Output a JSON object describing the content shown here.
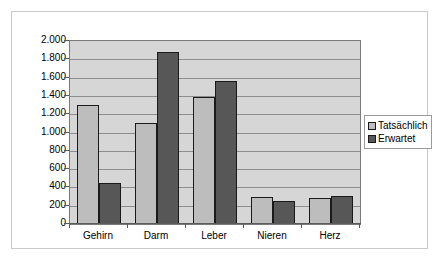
{
  "chart_data": {
    "type": "bar",
    "title": "",
    "subtitle": "",
    "xlabel": "",
    "ylabel": "",
    "categories": [
      "Gehirn",
      "Darm",
      "Leber",
      "Nieren",
      "Herz"
    ],
    "series": [
      {
        "name": "Tatsächlich",
        "color": "#bdbdbd",
        "values": [
          1300,
          1100,
          1390,
          300,
          280
        ]
      },
      {
        "name": "Erwartet",
        "color": "#575757",
        "values": [
          450,
          1880,
          1560,
          250,
          310
        ]
      }
    ],
    "ylim": [
      0,
      2000
    ],
    "ytick_step": 200,
    "ytick_labels": [
      "2.000",
      "1.800",
      "1.600",
      "1.400",
      "1.200",
      "1.000",
      "800",
      "600",
      "400",
      "200",
      "0"
    ],
    "ytick_values": [
      2000,
      1800,
      1600,
      1400,
      1200,
      1000,
      800,
      600,
      400,
      200,
      0
    ],
    "grid": true,
    "grid_axis": "y",
    "legend_position": "right",
    "plot_background": "#d6d6d6",
    "figure_background": "#ffffff",
    "bar_outline_color": "#1a1a1a",
    "axis_color": "#5a5a5a",
    "gridline_color": "#8d8d8d"
  },
  "legend": {
    "items": [
      {
        "label": "Tatsächlich",
        "swatch": "series-actual"
      },
      {
        "label": "Erwartet",
        "swatch": "series-expected"
      }
    ]
  }
}
